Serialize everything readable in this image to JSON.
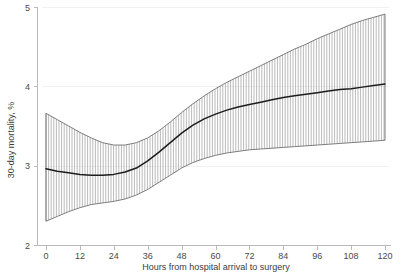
{
  "chart_data": {
    "type": "line",
    "title": "",
    "subtitle": "",
    "xlabel": "Hours from hospital arrival to surgery",
    "ylabel": "30-day mortality, %",
    "xlim": [
      0,
      120
    ],
    "ylim": [
      2,
      5
    ],
    "xticks": [
      0,
      12,
      24,
      36,
      48,
      60,
      72,
      84,
      96,
      108,
      120
    ],
    "xtick_labels": [
      "0",
      "12",
      "24",
      "36",
      "48",
      "60",
      "72",
      "84",
      "96",
      "108",
      "120"
    ],
    "yticks": [
      2,
      3,
      4,
      5
    ],
    "ytick_labels": [
      "2",
      "3",
      "4",
      "5"
    ],
    "grid": "horizontal-only",
    "legend": "none",
    "annotations": [],
    "series": [
      {
        "name": "Adjusted 30-day mortality",
        "style": "solid-line",
        "color": "#1c1c1c",
        "x": [
          0,
          4,
          8,
          12,
          16,
          20,
          24,
          28,
          32,
          36,
          40,
          44,
          48,
          52,
          56,
          60,
          64,
          68,
          72,
          76,
          80,
          84,
          88,
          92,
          96,
          100,
          104,
          108,
          112,
          116,
          120
        ],
        "values": [
          2.96,
          2.93,
          2.91,
          2.89,
          2.88,
          2.88,
          2.89,
          2.92,
          2.97,
          3.06,
          3.17,
          3.29,
          3.41,
          3.51,
          3.59,
          3.65,
          3.7,
          3.74,
          3.77,
          3.8,
          3.83,
          3.86,
          3.88,
          3.9,
          3.92,
          3.94,
          3.96,
          3.97,
          3.99,
          4.01,
          4.03
        ]
      },
      {
        "name": "95% CI upper bound",
        "style": "band-edge",
        "color": "#6f6f6f",
        "x": [
          0,
          4,
          8,
          12,
          16,
          20,
          24,
          28,
          32,
          36,
          40,
          44,
          48,
          52,
          56,
          60,
          64,
          68,
          72,
          76,
          80,
          84,
          88,
          92,
          96,
          100,
          104,
          108,
          112,
          116,
          120
        ],
        "values": [
          3.66,
          3.58,
          3.5,
          3.42,
          3.35,
          3.29,
          3.26,
          3.26,
          3.29,
          3.35,
          3.44,
          3.55,
          3.67,
          3.78,
          3.88,
          3.97,
          4.05,
          4.12,
          4.19,
          4.26,
          4.33,
          4.4,
          4.47,
          4.53,
          4.6,
          4.66,
          4.72,
          4.78,
          4.83,
          4.87,
          4.91
        ]
      },
      {
        "name": "95% CI lower bound",
        "style": "band-edge",
        "color": "#6f6f6f",
        "x": [
          0,
          4,
          8,
          12,
          16,
          20,
          24,
          28,
          32,
          36,
          40,
          44,
          48,
          52,
          56,
          60,
          64,
          68,
          72,
          76,
          80,
          84,
          88,
          92,
          96,
          100,
          104,
          108,
          112,
          116,
          120
        ],
        "values": [
          2.3,
          2.36,
          2.42,
          2.47,
          2.51,
          2.53,
          2.55,
          2.58,
          2.63,
          2.7,
          2.79,
          2.88,
          2.97,
          3.04,
          3.09,
          3.13,
          3.16,
          3.18,
          3.2,
          3.21,
          3.22,
          3.23,
          3.24,
          3.25,
          3.26,
          3.27,
          3.28,
          3.29,
          3.3,
          3.31,
          3.32
        ]
      }
    ],
    "band": {
      "name": "95% confidence interval",
      "fill_style": "vertical-hatch",
      "hatch_color": "#8c8c8c",
      "hatch_spacing_px": 2.6
    }
  }
}
